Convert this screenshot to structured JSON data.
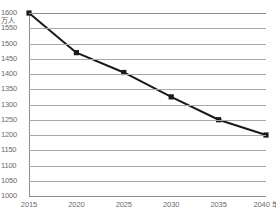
{
  "chart_data": {
    "type": "line",
    "title": "",
    "xlabel": "年",
    "ylabel": "万人",
    "unit_label": "万人",
    "x_axis_suffix": "年",
    "categories": [
      "2015",
      "2020",
      "2025",
      "2030",
      "2035",
      "2040"
    ],
    "x": [
      2015,
      2020,
      2025,
      2030,
      2035,
      2040
    ],
    "values": [
      1600,
      1470,
      1405,
      1325,
      1250,
      1200
    ],
    "series": [
      {
        "name": "人口",
        "values": [
          1600,
          1470,
          1405,
          1325,
          1250,
          1200
        ]
      }
    ],
    "ylim": [
      1000,
      1600
    ],
    "xlim": [
      2015,
      2040
    ],
    "y_ticks": [
      1600,
      1550,
      1500,
      1450,
      1400,
      1350,
      1300,
      1250,
      1200,
      1150,
      1100,
      1050,
      1000
    ],
    "x_ticks": [
      "2015",
      "2020",
      "2025",
      "2030",
      "2035",
      "2040"
    ],
    "y_tick_step": 50,
    "grid": true,
    "legend": false,
    "legend_position": "none",
    "marker": "square",
    "colors": {
      "line": "#1a1a1a",
      "marker": "#1a1a1a",
      "gridline": "#a8a8a8",
      "axis": "#8e8e8e",
      "tick_text": "#6b6b6b",
      "background": "#ffffff"
    }
  }
}
